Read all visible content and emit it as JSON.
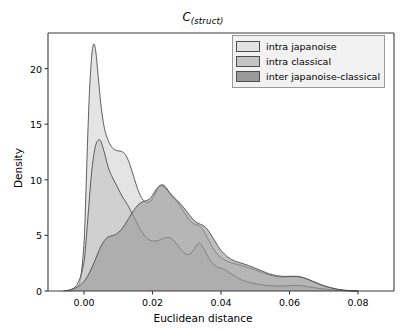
{
  "chart_data": {
    "type": "area",
    "title": "C(struct)",
    "title_base": "C",
    "title_sub": "(struct)",
    "xlabel": "Euclidean distance",
    "ylabel": "Density",
    "xlim": [
      -0.0105,
      0.0905
    ],
    "ylim": [
      0,
      23.2
    ],
    "grid": false,
    "legend_position": "upper right",
    "xticks": [
      0.0,
      0.02,
      0.04,
      0.06,
      0.08
    ],
    "xtick_labels": [
      "0.00",
      "0.02",
      "0.04",
      "0.06",
      "0.08"
    ],
    "yticks": [
      0,
      5,
      10,
      15,
      20
    ],
    "ytick_labels": [
      "0",
      "5",
      "10",
      "15",
      "20"
    ],
    "colors": {
      "intra_japanoise": "#e3e3e3",
      "intra_classical": "#c4c4c4",
      "inter_japanoise_classical": "#9a9a9a",
      "edge": "#4d4d4d",
      "axes": "#3a3a3a",
      "legend_face": "#f2f2f2"
    },
    "series": [
      {
        "name": "intra japanoise",
        "color": "#e3e3e3",
        "peak_x": 0.003,
        "peak_y": 22.2,
        "points": [
          [
            -0.004,
            0.0
          ],
          [
            -0.003,
            0.1
          ],
          [
            -0.002,
            0.35
          ],
          [
            -0.001,
            1.1
          ],
          [
            0.0,
            4.2
          ],
          [
            0.0005,
            8.2
          ],
          [
            0.001,
            13.0
          ],
          [
            0.0015,
            17.2
          ],
          [
            0.002,
            20.1
          ],
          [
            0.0025,
            21.8
          ],
          [
            0.003,
            22.2
          ],
          [
            0.0035,
            21.4
          ],
          [
            0.004,
            19.8
          ],
          [
            0.005,
            16.6
          ],
          [
            0.006,
            14.6
          ],
          [
            0.007,
            13.6
          ],
          [
            0.008,
            13.0
          ],
          [
            0.009,
            12.7
          ],
          [
            0.01,
            12.6
          ],
          [
            0.011,
            12.55
          ],
          [
            0.012,
            12.3
          ],
          [
            0.013,
            11.7
          ],
          [
            0.014,
            10.8
          ],
          [
            0.015,
            9.8
          ],
          [
            0.016,
            8.9
          ],
          [
            0.017,
            8.3
          ],
          [
            0.018,
            8.0
          ],
          [
            0.019,
            8.0
          ],
          [
            0.02,
            8.3
          ],
          [
            0.021,
            8.9
          ],
          [
            0.022,
            9.4
          ],
          [
            0.023,
            9.55
          ],
          [
            0.024,
            9.3
          ],
          [
            0.025,
            8.8
          ],
          [
            0.026,
            8.4
          ],
          [
            0.027,
            8.1
          ],
          [
            0.028,
            7.7
          ],
          [
            0.029,
            7.2
          ],
          [
            0.03,
            6.7
          ],
          [
            0.031,
            6.3
          ],
          [
            0.032,
            6.05
          ],
          [
            0.033,
            5.95
          ],
          [
            0.034,
            5.8
          ],
          [
            0.035,
            5.4
          ],
          [
            0.036,
            4.8
          ],
          [
            0.037,
            4.2
          ],
          [
            0.038,
            3.7
          ],
          [
            0.039,
            3.3
          ],
          [
            0.04,
            3.0
          ],
          [
            0.042,
            2.65
          ],
          [
            0.044,
            2.45
          ],
          [
            0.046,
            2.3
          ],
          [
            0.048,
            2.1
          ],
          [
            0.05,
            1.9
          ],
          [
            0.052,
            1.65
          ],
          [
            0.054,
            1.45
          ],
          [
            0.056,
            1.3
          ],
          [
            0.058,
            1.25
          ],
          [
            0.06,
            1.28
          ],
          [
            0.062,
            1.3
          ],
          [
            0.064,
            1.2
          ],
          [
            0.066,
            0.95
          ],
          [
            0.068,
            0.7
          ],
          [
            0.07,
            0.45
          ],
          [
            0.072,
            0.28
          ],
          [
            0.074,
            0.15
          ],
          [
            0.076,
            0.06
          ],
          [
            0.078,
            0.02
          ],
          [
            0.08,
            0.0
          ]
        ]
      },
      {
        "name": "intra classical",
        "color": "#c4c4c4",
        "peak_x": 0.0045,
        "peak_y": 13.6,
        "points": [
          [
            -0.005,
            0.0
          ],
          [
            -0.004,
            0.08
          ],
          [
            -0.003,
            0.25
          ],
          [
            -0.002,
            0.6
          ],
          [
            -0.001,
            1.3
          ],
          [
            0.0,
            2.6
          ],
          [
            0.0005,
            4.1
          ],
          [
            0.001,
            6.0
          ],
          [
            0.0015,
            8.0
          ],
          [
            0.002,
            9.9
          ],
          [
            0.0025,
            11.4
          ],
          [
            0.003,
            12.5
          ],
          [
            0.0035,
            13.2
          ],
          [
            0.004,
            13.5
          ],
          [
            0.0045,
            13.6
          ],
          [
            0.005,
            13.4
          ],
          [
            0.006,
            12.4
          ],
          [
            0.007,
            11.2
          ],
          [
            0.008,
            10.4
          ],
          [
            0.009,
            9.8
          ],
          [
            0.01,
            9.2
          ],
          [
            0.011,
            8.6
          ],
          [
            0.012,
            8.1
          ],
          [
            0.013,
            7.6
          ],
          [
            0.014,
            7.0
          ],
          [
            0.015,
            6.4
          ],
          [
            0.016,
            5.8
          ],
          [
            0.017,
            5.25
          ],
          [
            0.018,
            4.85
          ],
          [
            0.019,
            4.6
          ],
          [
            0.02,
            4.5
          ],
          [
            0.021,
            4.5
          ],
          [
            0.022,
            4.58
          ],
          [
            0.023,
            4.7
          ],
          [
            0.024,
            4.8
          ],
          [
            0.025,
            4.8
          ],
          [
            0.026,
            4.6
          ],
          [
            0.027,
            4.25
          ],
          [
            0.028,
            3.85
          ],
          [
            0.029,
            3.5
          ],
          [
            0.03,
            3.3
          ],
          [
            0.031,
            3.35
          ],
          [
            0.032,
            3.7
          ],
          [
            0.033,
            4.15
          ],
          [
            0.0335,
            4.3
          ],
          [
            0.034,
            4.25
          ],
          [
            0.035,
            3.8
          ],
          [
            0.036,
            3.2
          ],
          [
            0.037,
            2.7
          ],
          [
            0.038,
            2.35
          ],
          [
            0.039,
            2.15
          ],
          [
            0.04,
            2.05
          ],
          [
            0.041,
            1.95
          ],
          [
            0.042,
            1.75
          ],
          [
            0.044,
            1.35
          ],
          [
            0.046,
            1.0
          ],
          [
            0.048,
            0.8
          ],
          [
            0.05,
            0.65
          ],
          [
            0.052,
            0.55
          ],
          [
            0.054,
            0.48
          ],
          [
            0.056,
            0.45
          ],
          [
            0.058,
            0.45
          ],
          [
            0.06,
            0.48
          ],
          [
            0.062,
            0.5
          ],
          [
            0.064,
            0.45
          ],
          [
            0.066,
            0.36
          ],
          [
            0.068,
            0.26
          ],
          [
            0.07,
            0.18
          ],
          [
            0.072,
            0.11
          ],
          [
            0.074,
            0.06
          ],
          [
            0.076,
            0.03
          ],
          [
            0.078,
            0.01
          ],
          [
            0.08,
            0.0
          ]
        ]
      },
      {
        "name": "inter japanoise-classical",
        "color": "#9a9a9a",
        "peak_x": 0.0225,
        "peak_y": 9.5,
        "points": [
          [
            -0.006,
            0.0
          ],
          [
            -0.005,
            0.05
          ],
          [
            -0.004,
            0.12
          ],
          [
            -0.003,
            0.22
          ],
          [
            -0.002,
            0.35
          ],
          [
            -0.001,
            0.55
          ],
          [
            0.0,
            0.85
          ],
          [
            0.001,
            1.3
          ],
          [
            0.002,
            1.9
          ],
          [
            0.003,
            2.6
          ],
          [
            0.004,
            3.35
          ],
          [
            0.005,
            4.05
          ],
          [
            0.006,
            4.55
          ],
          [
            0.007,
            4.85
          ],
          [
            0.008,
            4.95
          ],
          [
            0.009,
            5.05
          ],
          [
            0.01,
            5.25
          ],
          [
            0.011,
            5.55
          ],
          [
            0.012,
            6.0
          ],
          [
            0.013,
            6.5
          ],
          [
            0.014,
            7.0
          ],
          [
            0.015,
            7.45
          ],
          [
            0.016,
            7.8
          ],
          [
            0.017,
            8.0
          ],
          [
            0.018,
            8.1
          ],
          [
            0.019,
            8.25
          ],
          [
            0.02,
            8.6
          ],
          [
            0.021,
            9.1
          ],
          [
            0.022,
            9.45
          ],
          [
            0.0225,
            9.5
          ],
          [
            0.023,
            9.45
          ],
          [
            0.024,
            9.2
          ],
          [
            0.025,
            8.85
          ],
          [
            0.026,
            8.5
          ],
          [
            0.027,
            8.2
          ],
          [
            0.028,
            7.9
          ],
          [
            0.029,
            7.55
          ],
          [
            0.03,
            7.15
          ],
          [
            0.031,
            6.75
          ],
          [
            0.032,
            6.4
          ],
          [
            0.033,
            6.15
          ],
          [
            0.034,
            6.0
          ],
          [
            0.035,
            5.85
          ],
          [
            0.036,
            5.55
          ],
          [
            0.037,
            5.1
          ],
          [
            0.038,
            4.6
          ],
          [
            0.039,
            4.1
          ],
          [
            0.04,
            3.65
          ],
          [
            0.042,
            3.05
          ],
          [
            0.044,
            2.7
          ],
          [
            0.046,
            2.5
          ],
          [
            0.048,
            2.3
          ],
          [
            0.05,
            2.05
          ],
          [
            0.052,
            1.8
          ],
          [
            0.054,
            1.55
          ],
          [
            0.056,
            1.4
          ],
          [
            0.058,
            1.32
          ],
          [
            0.06,
            1.32
          ],
          [
            0.062,
            1.32
          ],
          [
            0.064,
            1.2
          ],
          [
            0.066,
            0.98
          ],
          [
            0.068,
            0.72
          ],
          [
            0.07,
            0.48
          ],
          [
            0.072,
            0.3
          ],
          [
            0.074,
            0.16
          ],
          [
            0.076,
            0.07
          ],
          [
            0.078,
            0.02
          ],
          [
            0.08,
            0.0
          ]
        ]
      }
    ]
  },
  "legend": {
    "items": [
      {
        "label": "intra japanoise",
        "color": "#e3e3e3"
      },
      {
        "label": "intra classical",
        "color": "#c4c4c4"
      },
      {
        "label": "inter japanoise-classical",
        "color": "#9a9a9a"
      }
    ]
  }
}
